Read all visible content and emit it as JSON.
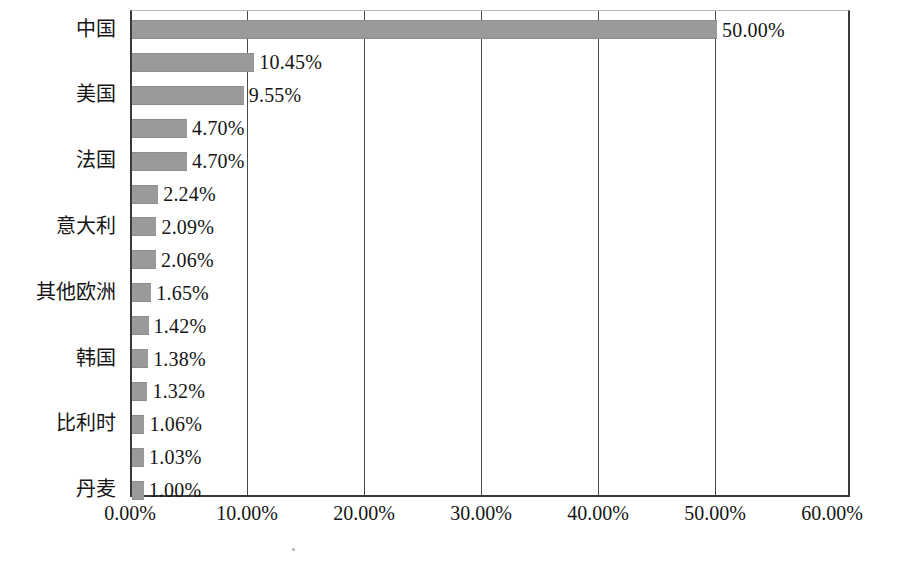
{
  "chart_data": {
    "type": "bar",
    "orientation": "horizontal",
    "title": "",
    "xlabel": "",
    "ylabel": "",
    "xlim": [
      0,
      60
    ],
    "grid": true,
    "legend": "none",
    "xticks": [
      "0.00%",
      "10.00%",
      "20.00%",
      "30.00%",
      "40.00%",
      "50.00%",
      "60.00%"
    ],
    "xtick_values": [
      0,
      10,
      20,
      30,
      40,
      50,
      60
    ],
    "categories": [
      "中国",
      "",
      "美国",
      "",
      "法国",
      "",
      "意大利",
      "",
      "其他欧洲",
      "",
      "韩国",
      "",
      "比利时",
      "",
      "丹麦"
    ],
    "values": [
      50.0,
      10.45,
      9.55,
      4.7,
      4.7,
      2.24,
      2.09,
      2.06,
      1.65,
      1.42,
      1.38,
      1.32,
      1.06,
      1.03,
      1.0
    ],
    "data_labels": [
      "50.00%",
      "10.45%",
      "9.55%",
      "4.70%",
      "4.70%",
      "2.24%",
      "2.09%",
      "2.06%",
      "1.65%",
      "1.42%",
      "1.38%",
      "1.32%",
      "1.06%",
      "1.03%",
      "1.00%"
    ],
    "visible_category_labels": [
      {
        "index": 0,
        "label": "中国"
      },
      {
        "index": 2,
        "label": "美国"
      },
      {
        "index": 4,
        "label": "法国"
      },
      {
        "index": 6,
        "label": "意大利"
      },
      {
        "index": 8,
        "label": "其他欧洲"
      },
      {
        "index": 10,
        "label": "韩国"
      },
      {
        "index": 12,
        "label": "比利时"
      },
      {
        "index": 14,
        "label": "丹麦"
      }
    ],
    "bar_color": "#9a9a9a",
    "axis_color": "#3a3a3a",
    "grid_color": "#4a4a4a"
  }
}
